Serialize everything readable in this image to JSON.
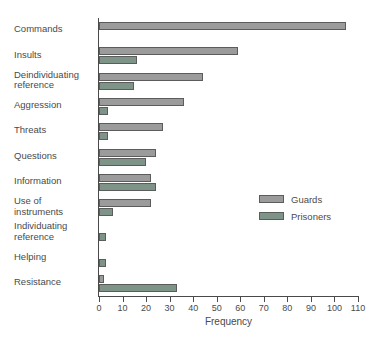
{
  "chart_data": {
    "type": "bar",
    "orientation": "horizontal",
    "title": "",
    "xlabel": "Frequency",
    "ylabel": "",
    "xlim": [
      0,
      110
    ],
    "xticks": [
      0,
      10,
      20,
      30,
      40,
      50,
      60,
      70,
      80,
      90,
      100,
      110
    ],
    "grid": false,
    "legend_position": "middle-right",
    "categories": [
      "Commands",
      "Insults",
      "Deindividuating\nreference",
      "Aggression",
      "Threats",
      "Questions",
      "Information",
      "Use of\ninstruments",
      "Individuating\nreference",
      "Helping",
      "Resistance"
    ],
    "series": [
      {
        "name": "Guards",
        "color": "#9b9b9b",
        "values": [
          105,
          59,
          44,
          36,
          27,
          24,
          22,
          22,
          0,
          0,
          2
        ]
      },
      {
        "name": "Prisoners",
        "color": "#7f9489",
        "values": [
          0,
          16,
          15,
          4,
          4,
          20,
          24,
          6,
          3,
          3,
          33
        ]
      }
    ]
  },
  "legend": {
    "items": [
      {
        "label": "Guards",
        "color": "#9b9b9b"
      },
      {
        "label": "Prisoners",
        "color": "#7f9489"
      }
    ]
  },
  "axis": {
    "x_title": "Frequency",
    "tick_labels": [
      "0",
      "10",
      "20",
      "30",
      "40",
      "50",
      "60",
      "70",
      "80",
      "90",
      "100",
      "110"
    ]
  }
}
